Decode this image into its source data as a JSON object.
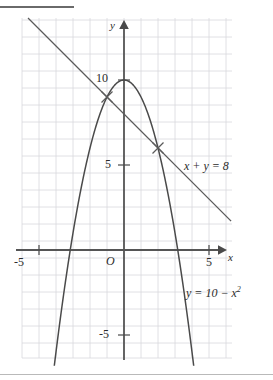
{
  "figure": {
    "title_rule": "",
    "background_color": "#ffffff",
    "grid_color": "#d8d8dd",
    "curve_color": "#4a4a4a",
    "axis_color": "#555555",
    "text_color": "#2b2b2b"
  },
  "axes": {
    "x_axis_label": "x",
    "y_axis_label": "y",
    "origin_label": "O",
    "x_ticks": [
      {
        "value": -5,
        "label": "-5"
      },
      {
        "value": 5,
        "label": "5"
      }
    ],
    "y_ticks": [
      {
        "value": 10,
        "label": "10"
      },
      {
        "value": 5,
        "label": "5"
      },
      {
        "value": -5,
        "label": "-5"
      }
    ],
    "x_range": [
      -6,
      6.5
    ],
    "y_range": [
      -6.5,
      13.5
    ],
    "grid": true,
    "grid_step": 1
  },
  "annotations": {
    "line_label": "x + y = 8",
    "parabola_label_lhs": "y = 10 − x",
    "parabola_label_exp": "2"
  },
  "chart_data": {
    "type": "line",
    "title": "",
    "xlabel": "x",
    "ylabel": "y",
    "xlim": [
      -6,
      6.5
    ],
    "ylim": [
      -6.5,
      13.5
    ],
    "grid": true,
    "legend": "none",
    "series": [
      {
        "name": "y = 10 - x^2",
        "kind": "parabola",
        "equation": "y = 10 - x^2",
        "vertex": [
          0,
          10
        ],
        "roots": [
          -3.162,
          3.162
        ],
        "x": [
          -4.1,
          -3.5,
          -3.0,
          -2.5,
          -2.0,
          -1.5,
          -1.0,
          -0.5,
          0.0,
          0.5,
          1.0,
          1.5,
          2.0,
          2.5,
          3.0,
          3.5,
          4.1
        ],
        "values": [
          -6.81,
          -2.25,
          1.0,
          3.75,
          6.0,
          7.75,
          9.0,
          9.75,
          10.0,
          9.75,
          9.0,
          7.75,
          6.0,
          3.75,
          1.0,
          -2.25,
          -6.81
        ]
      },
      {
        "name": "x + y = 8",
        "kind": "straight-line",
        "equation": "x + y = 8",
        "slope": -1,
        "intercept": 8,
        "x": [
          -5.9,
          6.3
        ],
        "values": [
          13.9,
          1.7
        ]
      }
    ],
    "intersections": [
      {
        "x": -1,
        "y": 9,
        "marker": "cross"
      },
      {
        "x": 2,
        "y": 6,
        "marker": "cross"
      }
    ],
    "annotations": [
      {
        "text": "x + y = 8",
        "x": 3.7,
        "y": 5.45
      },
      {
        "text": "y = 10 - x²",
        "x": 4.0,
        "y": -2.5
      }
    ]
  }
}
